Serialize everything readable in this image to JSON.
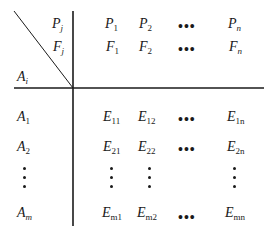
{
  "diagram": {
    "type": "decision-matrix",
    "corner_labels": {
      "column_index_top": {
        "base": "P",
        "sub": "j"
      },
      "column_index_bottom": {
        "base": "F",
        "sub": "j"
      },
      "row_index": {
        "base": "A",
        "sub": "i"
      }
    },
    "header_rows": [
      {
        "name": "P",
        "cells": [
          {
            "base": "P",
            "sub": "1"
          },
          {
            "base": "P",
            "sub": "2"
          },
          {
            "ellipsis": "•••"
          },
          {
            "base": "P",
            "sub": "n"
          }
        ]
      },
      {
        "name": "F",
        "cells": [
          {
            "base": "F",
            "sub": "1"
          },
          {
            "base": "F",
            "sub": "2"
          },
          {
            "ellipsis": "•••"
          },
          {
            "base": "F",
            "sub": "n"
          }
        ]
      }
    ],
    "rows": [
      {
        "label": {
          "base": "A",
          "sub": "1"
        },
        "cells": [
          {
            "base": "E",
            "sub": "11"
          },
          {
            "base": "E",
            "sub": "12"
          },
          {
            "ellipsis": "•••"
          },
          {
            "base": "E",
            "sub": "1n"
          }
        ]
      },
      {
        "label": {
          "base": "A",
          "sub": "2"
        },
        "cells": [
          {
            "base": "E",
            "sub": "21"
          },
          {
            "base": "E",
            "sub": "22"
          },
          {
            "ellipsis": "•••"
          },
          {
            "base": "E",
            "sub": "2n"
          }
        ]
      },
      {
        "label": {
          "vdots": true
        },
        "cells": [
          {
            "vdots": true
          },
          {
            "vdots": true
          },
          {
            "blank": true
          },
          {
            "vdots": true
          }
        ]
      },
      {
        "label": {
          "base": "A",
          "sub": "m"
        },
        "cells": [
          {
            "base": "E",
            "sub": "m1"
          },
          {
            "base": "E",
            "sub": "m2"
          },
          {
            "ellipsis": "•••"
          },
          {
            "base": "E",
            "sub": "mn"
          }
        ]
      }
    ],
    "colors": {
      "ink": "#1a1a1a",
      "background": "#ffffff"
    }
  }
}
